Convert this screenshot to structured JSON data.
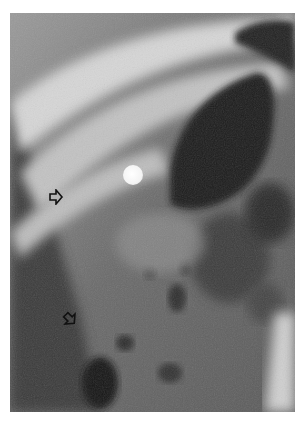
{
  "image": {
    "type": "radiograph",
    "description": "Grayscale abdominal X-ray with two open arrow annotations and a round radiopaque marker",
    "background_color": "#ffffff",
    "bounds": {
      "left": 10,
      "top": 13,
      "width": 285,
      "height": 399
    }
  },
  "annotations": {
    "arrows": [
      {
        "name": "arrow-upper",
        "direction": "right",
        "x": 55,
        "y": 196
      },
      {
        "name": "arrow-lower",
        "direction": "down-right",
        "x": 65,
        "y": 318
      }
    ],
    "marker": {
      "shape": "circle",
      "color": "#ffffff",
      "x": 133,
      "y": 175,
      "diameter": 20
    }
  }
}
